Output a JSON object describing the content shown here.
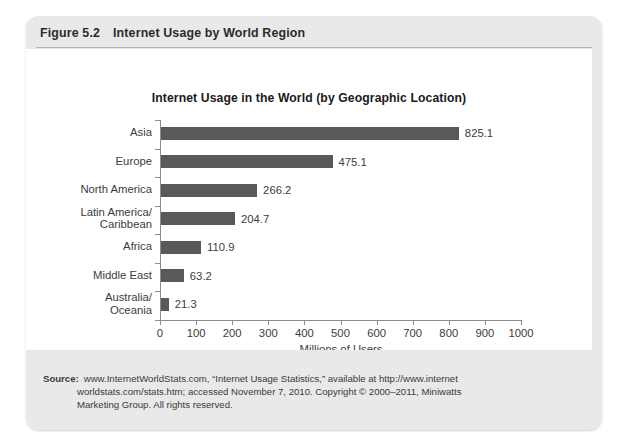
{
  "figure": {
    "number": "Figure 5.2",
    "caption": "Internet Usage by World Region"
  },
  "chart_data": {
    "type": "bar",
    "orientation": "horizontal",
    "title": "Internet Usage in the World (by Geographic Location)",
    "xlabel": "Millions of Users",
    "ylabel": "",
    "categories": [
      "Asia",
      "Europe",
      "North America",
      "Latin America/\nCaribbean",
      "Africa",
      "Middle East",
      "Australia/\nOceania"
    ],
    "values": [
      825.1,
      475.1,
      266.2,
      204.7,
      110.9,
      63.2,
      21.3
    ],
    "value_labels": [
      "825.1",
      "475.1",
      "266.2",
      "204.7",
      "110.9",
      "63.2",
      "21.3"
    ],
    "xlim": [
      0,
      1000
    ],
    "xticks": [
      0,
      100,
      200,
      300,
      400,
      500,
      600,
      700,
      800,
      900,
      1000
    ],
    "xtick_labels": [
      "0",
      "100",
      "200",
      "300",
      "400",
      "500",
      "600",
      "700",
      "800",
      "900",
      "1000"
    ],
    "grid": false,
    "legend": null,
    "bar_color": "#595959",
    "axis_color": "#8c8c8c",
    "text_color": "#3c3c3c"
  },
  "source": {
    "label": "Source:",
    "line1": "www.InternetWorldStats.com, “Internet Usage Statistics,” available at http://www.internet",
    "line2": "worldstats.com/stats.htm; accessed November 7, 2010. Copyright © 2000–2011, Miniwatts",
    "line3": "Marketing Group. All rights reserved."
  },
  "theme": {
    "card_background": "#e9e9e9",
    "panel_background": "#ffffff",
    "rule_color": "#b4b4b4"
  }
}
